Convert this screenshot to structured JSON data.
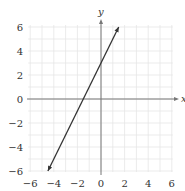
{
  "chart_data": {
    "type": "line",
    "title": "",
    "xlabel": "x",
    "ylabel": "y",
    "xlim": [
      -6,
      6
    ],
    "ylim": [
      -6,
      6
    ],
    "grid": true,
    "grid_step": 1,
    "x_ticks": [
      -6,
      -4,
      -2,
      0,
      2,
      4,
      6
    ],
    "y_ticks": [
      -6,
      -4,
      -2,
      0,
      2,
      4,
      6
    ],
    "x_tick_labels": [
      "−6",
      "−4",
      "−2",
      "0",
      "2",
      "4",
      "6"
    ],
    "y_tick_labels": [
      "−6",
      "−4",
      "−2",
      "0",
      "2",
      "4",
      "6"
    ],
    "series": [
      {
        "name": "line",
        "equation": "y = 2x + 3",
        "slope": 2,
        "intercept": 3,
        "x": [
          -4.5,
          1.5
        ],
        "y": [
          -6,
          6
        ],
        "arrows": "both",
        "color": "#333333"
      }
    ],
    "x_intercept": -1.5,
    "y_intercept": 3
  },
  "colors": {
    "grid": "#e6e6e6",
    "axis": "#777777",
    "line": "#333333",
    "text": "#333333"
  }
}
